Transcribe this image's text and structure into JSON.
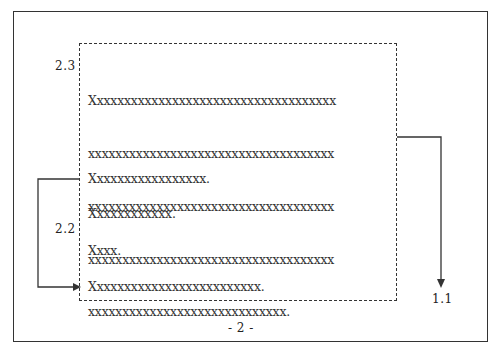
{
  "diagram": {
    "labels": {
      "section_2_3": "2.3",
      "section_2_2": "2.2",
      "section_1_1": "1.1",
      "page_number": "- 2 -"
    },
    "paragraphs": [
      {
        "lines": [
          "Xxxxxxxxxxxxxxxxxxxxxxxxxxxxxxxxxxxx",
          "xxxxxxxxxxxxxxxxxxxxxxxxxxxxxxxxxxxx",
          "xxxxxxxxxxxxxxxxxxxxxxxxxxxxxxxxxxxx",
          "xxxxxxxxxxxxxxxxxxxxxxxxxxxxxxxxxxxx",
          "xxxxxxxxxxxxxxxxxxxxxxxxxxxxx."
        ]
      },
      {
        "lines": [
          "Xxxxxxxxxxxxxxxxx."
        ]
      },
      {
        "lines": [
          "Xxxxxxxxxxxx."
        ]
      },
      {
        "lines": [
          "Xxxx."
        ]
      },
      {
        "lines": [
          "Xxxxxxxxxxxxxxxxxxxxxxxxx."
        ]
      }
    ],
    "connectors": [
      {
        "from": "dashed-box-right-edge",
        "to": "1.1",
        "style": "arrow-down"
      },
      {
        "from": "paragraph-2",
        "to": "paragraph-5",
        "style": "loop-left-arrow"
      }
    ]
  }
}
